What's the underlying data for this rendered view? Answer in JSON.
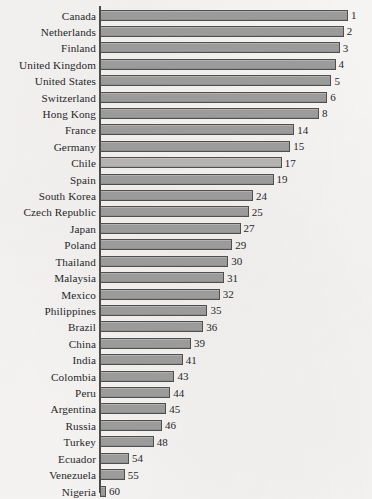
{
  "chart_data": {
    "type": "bar",
    "orientation": "horizontal",
    "title": "",
    "subtitle": "",
    "xlabel": "",
    "ylabel": "",
    "grid": false,
    "legend": false,
    "axis_ticks_visible": false,
    "value_labels_shown": true,
    "note": "Rank values; bar length is inverse to rank (rank 1 = longest bar).",
    "scale": {
      "bar_length_rule": "inverted-rank",
      "rank_min": 1,
      "rank_max": 60,
      "max_bar_px": 248,
      "axis_x_px": 100
    },
    "categories": [
      "Canada",
      "Netherlands",
      "Finland",
      "United Kingdom",
      "United States",
      "Switzerland",
      "Hong Kong",
      "France",
      "Germany",
      "Chile",
      "Spain",
      "South Korea",
      "Czech Republic",
      "Japan",
      "Poland",
      "Thailand",
      "Malaysia",
      "Mexico",
      "Philippines",
      "Brazil",
      "China",
      "India",
      "Colombia",
      "Peru",
      "Argentina",
      "Russia",
      "Turkey",
      "Ecuador",
      "Venezuela",
      "Nigeria"
    ],
    "values": [
      1,
      2,
      3,
      4,
      5,
      6,
      8,
      14,
      15,
      17,
      19,
      24,
      25,
      27,
      29,
      30,
      31,
      32,
      35,
      36,
      39,
      41,
      43,
      44,
      45,
      46,
      48,
      54,
      55,
      60
    ],
    "highlighted_categories": [
      "Chile"
    ],
    "colors": {
      "bar_fill": "#9b9b9b",
      "bar_fill_highlight": "#b4b3b1",
      "bar_border": "#4f4f4d",
      "axis": "#4a4a48",
      "text": "#27262a",
      "background": "#f7f6f4"
    }
  }
}
